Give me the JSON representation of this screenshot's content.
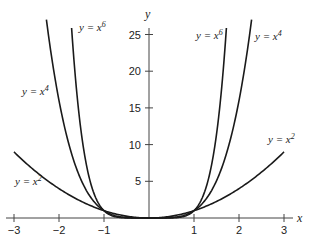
{
  "chart_data": {
    "type": "line",
    "title": "",
    "xlabel": "x",
    "ylabel": "y",
    "xlim": [
      -3.1,
      3.2
    ],
    "ylim": [
      0,
      28
    ],
    "grid": false,
    "x_ticks": [
      -3,
      -2,
      -1,
      1,
      2,
      3
    ],
    "x_tick_labels": [
      "−3",
      "−2",
      "−1",
      "1",
      "2",
      "3"
    ],
    "y_ticks": [
      5,
      10,
      15,
      20,
      25
    ],
    "y_tick_labels": [
      "5",
      "10",
      "15",
      "20",
      "25"
    ],
    "series": [
      {
        "name": "y = x^2",
        "label_base": "y = x",
        "exponent": "2",
        "power": 2,
        "x_range": [
          -3,
          3
        ]
      },
      {
        "name": "y = x^4",
        "label_base": "y = x",
        "exponent": "4",
        "power": 4,
        "x_range": [
          -2.28,
          2.28
        ]
      },
      {
        "name": "y = x^6",
        "label_base": "y = x",
        "exponent": "6",
        "power": 6,
        "x_range": [
          -1.72,
          1.72
        ]
      }
    ],
    "annotations": [
      {
        "series": "y = x^6",
        "side": "left",
        "text": "y = x",
        "sup": "6"
      },
      {
        "series": "y = x^6",
        "side": "right",
        "text": "y = x",
        "sup": "6"
      },
      {
        "series": "y = x^4",
        "side": "left",
        "text": "y = x",
        "sup": "4"
      },
      {
        "series": "y = x^4",
        "side": "right",
        "text": "y = x",
        "sup": "4"
      },
      {
        "series": "y = x^2",
        "side": "left",
        "text": "y = x",
        "sup": "2"
      },
      {
        "series": "y = x^2",
        "side": "right",
        "text": "y = x",
        "sup": "2"
      }
    ],
    "legend": "none (inline curve labels)"
  },
  "labels": {
    "x_axis": "x",
    "y_axis": "y",
    "x6_left": {
      "base": "y = x",
      "sup": "6"
    },
    "x6_right": {
      "base": "y = x",
      "sup": "6"
    },
    "x4_left": {
      "base": "y = x",
      "sup": "4"
    },
    "x4_right": {
      "base": "y = x",
      "sup": "4"
    },
    "x2_left": {
      "base": "y = x",
      "sup": "2"
    },
    "x2_right": {
      "base": "y = x",
      "sup": "2"
    }
  },
  "colors": {
    "curve": "#1a1a1a",
    "axis": "#444444",
    "text": "#222222",
    "background": "#ffffff"
  }
}
